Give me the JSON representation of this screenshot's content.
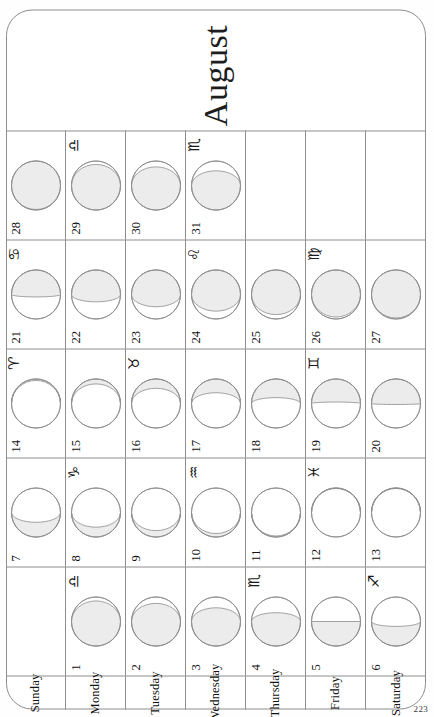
{
  "document": {
    "month_title": "August",
    "page_number": "223"
  },
  "weekday_labels": [
    "Sunday",
    "Monday",
    "Tuesday",
    "Wednesday",
    "Thursday",
    "Friday",
    "Saturday"
  ],
  "colors": {
    "shade": "#ececec",
    "outline": "#8d8d8d",
    "text": "#111111",
    "paper": "#ffffff"
  },
  "zodiac_glyphs": {
    "aries": "♈",
    "taurus": "♉",
    "gemini": "♊",
    "cancer": "♋",
    "leo": "♌",
    "virgo": "♍",
    "libra": "♎",
    "scorpio": "♏",
    "sagittarius": "♐",
    "capricorn": "♑",
    "aquarius": "♒",
    "pisces": "♓"
  },
  "grid": {
    "weeks": 5,
    "weekdays": 7,
    "rows": [
      {
        "weekday": "Sunday",
        "cells": [
          {
            "day": "",
            "zodiac": "",
            "illum": null,
            "waxing": null,
            "empty": true
          },
          {
            "day": "7",
            "zodiac": "",
            "illum": 0.3,
            "waxing": false
          },
          {
            "day": "14",
            "zodiac": "♈",
            "illum": 0.03,
            "waxing": true
          },
          {
            "day": "21",
            "zodiac": "♋",
            "illum": 0.55,
            "waxing": true
          },
          {
            "day": "28",
            "zodiac": "",
            "illum": 0.99,
            "waxing": true
          }
        ]
      },
      {
        "weekday": "Monday",
        "cells": [
          {
            "day": "1",
            "zodiac": "♎",
            "illum": 0.92,
            "waxing": false
          },
          {
            "day": "8",
            "zodiac": "♑",
            "illum": 0.2,
            "waxing": false
          },
          {
            "day": "15",
            "zodiac": "",
            "illum": 0.1,
            "waxing": true
          },
          {
            "day": "22",
            "zodiac": "",
            "illum": 0.65,
            "waxing": true
          },
          {
            "day": "29",
            "zodiac": "♎",
            "illum": 0.93,
            "waxing": false
          }
        ]
      },
      {
        "weekday": "Tuesday",
        "cells": [
          {
            "day": "2",
            "zodiac": "",
            "illum": 0.87,
            "waxing": false
          },
          {
            "day": "9",
            "zodiac": "",
            "illum": 0.13,
            "waxing": false
          },
          {
            "day": "16",
            "zodiac": "♉",
            "illum": 0.19,
            "waxing": true
          },
          {
            "day": "23",
            "zodiac": "",
            "illum": 0.75,
            "waxing": true
          },
          {
            "day": "30",
            "zodiac": "",
            "illum": 0.88,
            "waxing": false
          }
        ]
      },
      {
        "weekday": "Wednesday",
        "cells": [
          {
            "day": "3",
            "zodiac": "",
            "illum": 0.78,
            "waxing": false
          },
          {
            "day": "10",
            "zodiac": "♒",
            "illum": 0.07,
            "waxing": false
          },
          {
            "day": "17",
            "zodiac": "",
            "illum": 0.28,
            "waxing": true
          },
          {
            "day": "24",
            "zodiac": "♌",
            "illum": 0.84,
            "waxing": true
          },
          {
            "day": "31",
            "zodiac": "♏",
            "illum": 0.8,
            "waxing": false
          }
        ]
      },
      {
        "weekday": "Thursday",
        "cells": [
          {
            "day": "4",
            "zodiac": "♏",
            "illum": 0.68,
            "waxing": false
          },
          {
            "day": "11",
            "zodiac": "",
            "illum": 0.02,
            "waxing": false
          },
          {
            "day": "18",
            "zodiac": "",
            "illum": 0.38,
            "waxing": true
          },
          {
            "day": "25",
            "zodiac": "",
            "illum": 0.91,
            "waxing": true
          }
        ]
      },
      {
        "weekday": "Friday",
        "cells": [
          {
            "day": "5",
            "zodiac": "",
            "illum": 0.5,
            "waxing": false
          },
          {
            "day": "12",
            "zodiac": "♓",
            "illum": 0.01,
            "waxing": true
          },
          {
            "day": "19",
            "zodiac": "♊",
            "illum": 0.47,
            "waxing": true
          },
          {
            "day": "26",
            "zodiac": "♍",
            "illum": 0.96,
            "waxing": true
          }
        ]
      },
      {
        "weekday": "Saturday",
        "cells": [
          {
            "day": "6",
            "zodiac": "♐",
            "illum": 0.4,
            "waxing": false
          },
          {
            "day": "13",
            "zodiac": "",
            "illum": 0.01,
            "waxing": true
          },
          {
            "day": "20",
            "zodiac": "",
            "illum": 0.52,
            "waxing": true
          },
          {
            "day": "27",
            "zodiac": "",
            "illum": 0.98,
            "waxing": true
          }
        ]
      }
    ]
  }
}
